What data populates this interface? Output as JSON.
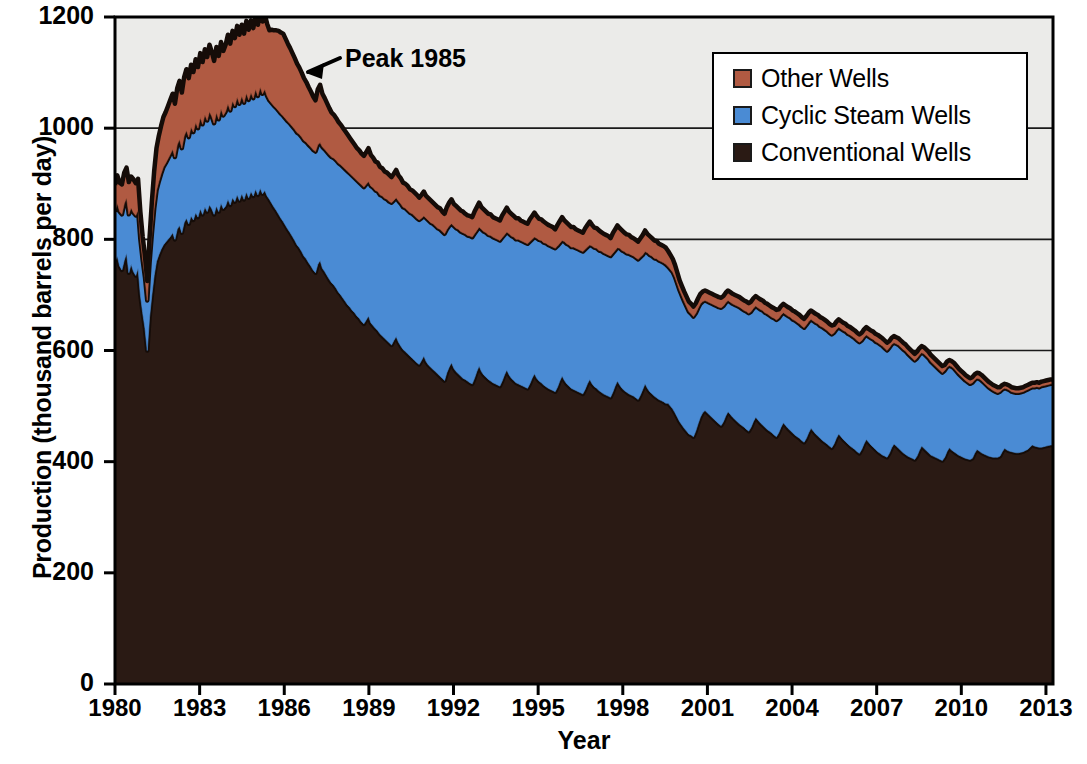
{
  "chart_data": {
    "type": "area",
    "stacked": true,
    "title": "",
    "xlabel": "Year",
    "ylabel": "Production (thousand barrels per day)",
    "xlim": [
      1980,
      2013.25
    ],
    "ylim": [
      0,
      1200
    ],
    "ytick_labels": [
      "0",
      "200",
      "400",
      "600",
      "800",
      "1000",
      "1200"
    ],
    "yticks": [
      0,
      200,
      400,
      600,
      800,
      1000,
      1200
    ],
    "xtick_labels": [
      "1980",
      "1983",
      "1986",
      "1989",
      "1992",
      "1995",
      "1998",
      "2001",
      "2004",
      "2007",
      "2010",
      "2013"
    ],
    "xticks": [
      1980,
      1983,
      1986,
      1989,
      1992,
      1995,
      1998,
      2001,
      2004,
      2007,
      2010,
      2013
    ],
    "grid": "horizontal",
    "legend_position": "top-right",
    "plot_background": "#ebebe9",
    "series": [
      {
        "name": "Conventional Wells",
        "color": "#2a1a14",
        "order": 1,
        "values": [
          760,
          770,
          752,
          745,
          762,
          775,
          740,
          755,
          742,
          735,
          748,
          700,
          668,
          640,
          600,
          660,
          700,
          735,
          760,
          772,
          782,
          790,
          795,
          800,
          805,
          812,
          800,
          818,
          825,
          812,
          830,
          838,
          828,
          842,
          835,
          848,
          840,
          855,
          845,
          858,
          850,
          862,
          855,
          845,
          860,
          850,
          865,
          855,
          860,
          872,
          862,
          875,
          868,
          880,
          870,
          882,
          872,
          885,
          875,
          886,
          878,
          890,
          880,
          892,
          882,
          888,
          878,
          872,
          865,
          858,
          852,
          845,
          838,
          832,
          825,
          818,
          812,
          805,
          798,
          790,
          785,
          778,
          770,
          765,
          758,
          752,
          745,
          740,
          755,
          762,
          748,
          742,
          735,
          728,
          722,
          718,
          712,
          705,
          700,
          694,
          688,
          682,
          678,
          672,
          668,
          662,
          658,
          652,
          648,
          655,
          662,
          650,
          645,
          640,
          636,
          630,
          626,
          622,
          618,
          614,
          610,
          618,
          625,
          615,
          608,
          602,
          598,
          594,
          590,
          586,
          582,
          578,
          575,
          582,
          590,
          580,
          574,
          570,
          566,
          562,
          558,
          554,
          550,
          546,
          560,
          570,
          578,
          568,
          562,
          558,
          554,
          550,
          548,
          545,
          542,
          540,
          550,
          562,
          572,
          562,
          556,
          552,
          548,
          545,
          542,
          540,
          538,
          536,
          545,
          556,
          565,
          556,
          550,
          546,
          542,
          540,
          538,
          536,
          534,
          532,
          540,
          550,
          558,
          550,
          545,
          542,
          538,
          535,
          532,
          530,
          528,
          526,
          534,
          545,
          554,
          546,
          540,
          536,
          532,
          530,
          528,
          526,
          524,
          522,
          530,
          540,
          548,
          540,
          535,
          532,
          528,
          525,
          522,
          520,
          518,
          516,
          525,
          536,
          545,
          538,
          532,
          528,
          525,
          522,
          520,
          518,
          515,
          512,
          520,
          530,
          540,
          532,
          526,
          522,
          518,
          515,
          512,
          510,
          508,
          505,
          505,
          500,
          495,
          488,
          480,
          472,
          466,
          460,
          455,
          450,
          448,
          445,
          455,
          468,
          480,
          488,
          492,
          488,
          484,
          480,
          476,
          472,
          468,
          465,
          472,
          482,
          490,
          485,
          480,
          476,
          472,
          468,
          465,
          462,
          458,
          455,
          462,
          472,
          480,
          475,
          470,
          466,
          462,
          458,
          455,
          452,
          448,
          445,
          452,
          462,
          470,
          465,
          460,
          456,
          452,
          448,
          445,
          442,
          438,
          435,
          442,
          452,
          460,
          455,
          450,
          446,
          442,
          438,
          435,
          432,
          428,
          425,
          432,
          442,
          450,
          445,
          440,
          436,
          432,
          428,
          425,
          422,
          418,
          415,
          422,
          432,
          440,
          435,
          430,
          426,
          422,
          418,
          415,
          412,
          410,
          408,
          415,
          425,
          432,
          428,
          424,
          420,
          416,
          413,
          410,
          408,
          406,
          404,
          410,
          420,
          428,
          424,
          420,
          416,
          412,
          410,
          408,
          406,
          404,
          402,
          408,
          418,
          425,
          421,
          418,
          415,
          412,
          410,
          408,
          406,
          405,
          404,
          406,
          415,
          422,
          419,
          416,
          414,
          412,
          410,
          409,
          408,
          408,
          408,
          410,
          418,
          424,
          421,
          419,
          418,
          417,
          416,
          416,
          417,
          418,
          420,
          422,
          426,
          430,
          428,
          427,
          426,
          426,
          427,
          428,
          429,
          430,
          430
        ]
      },
      {
        "name": "Cyclic Steam Wells",
        "color": "#4a8bd4",
        "order": 2,
        "values": [
          90,
          95,
          98,
          100,
          102,
          100,
          105,
          102,
          106,
          108,
          105,
          100,
          95,
          92,
          90,
          98,
          110,
          120,
          128,
          132,
          136,
          140,
          142,
          145,
          148,
          150,
          148,
          152,
          155,
          152,
          156,
          158,
          156,
          160,
          158,
          162,
          160,
          164,
          162,
          166,
          164,
          168,
          166,
          164,
          168,
          166,
          170,
          168,
          170,
          172,
          170,
          174,
          172,
          176,
          174,
          176,
          174,
          178,
          176,
          178,
          176,
          180,
          178,
          182,
          180,
          182,
          180,
          178,
          180,
          182,
          184,
          186,
          188,
          190,
          192,
          194,
          196,
          198,
          200,
          202,
          204,
          206,
          208,
          210,
          212,
          214,
          216,
          218,
          215,
          212,
          218,
          220,
          222,
          224,
          226,
          228,
          230,
          232,
          234,
          236,
          238,
          240,
          240,
          242,
          242,
          244,
          244,
          246,
          246,
          244,
          242,
          246,
          248,
          248,
          250,
          250,
          252,
          252,
          254,
          254,
          256,
          252,
          250,
          254,
          256,
          256,
          258,
          258,
          258,
          260,
          260,
          260,
          260,
          256,
          252,
          258,
          260,
          260,
          262,
          262,
          262,
          264,
          264,
          264,
          258,
          254,
          250,
          256,
          258,
          260,
          260,
          262,
          262,
          262,
          264,
          264,
          260,
          254,
          250,
          256,
          258,
          260,
          260,
          262,
          262,
          262,
          262,
          262,
          258,
          252,
          248,
          254,
          256,
          258,
          258,
          260,
          260,
          260,
          260,
          260,
          256,
          250,
          246,
          252,
          254,
          256,
          256,
          258,
          258,
          258,
          258,
          258,
          254,
          248,
          244,
          250,
          252,
          254,
          254,
          256,
          256,
          256,
          256,
          256,
          252,
          246,
          242,
          248,
          250,
          252,
          252,
          254,
          254,
          254,
          254,
          254,
          250,
          244,
          240,
          246,
          248,
          250,
          250,
          252,
          252,
          252,
          252,
          252,
          248,
          242,
          238,
          244,
          246,
          248,
          248,
          250,
          250,
          250,
          250,
          250,
          246,
          246,
          246,
          244,
          240,
          236,
          232,
          228,
          224,
          220,
          218,
          216,
          212,
          208,
          204,
          200,
          198,
          200,
          202,
          204,
          206,
          208,
          210,
          212,
          208,
          204,
          200,
          202,
          204,
          206,
          208,
          210,
          210,
          210,
          212,
          212,
          208,
          204,
          200,
          202,
          204,
          206,
          206,
          208,
          208,
          208,
          210,
          210,
          206,
          202,
          198,
          200,
          202,
          204,
          204,
          206,
          206,
          206,
          206,
          206,
          204,
          200,
          196,
          198,
          200,
          202,
          202,
          204,
          204,
          204,
          204,
          204,
          200,
          196,
          192,
          194,
          196,
          198,
          198,
          200,
          200,
          200,
          200,
          200,
          196,
          192,
          188,
          190,
          192,
          194,
          194,
          196,
          196,
          196,
          194,
          192,
          190,
          186,
          182,
          184,
          186,
          186,
          186,
          186,
          184,
          182,
          180,
          178,
          176,
          172,
          168,
          170,
          170,
          170,
          168,
          166,
          164,
          162,
          160,
          158,
          156,
          152,
          148,
          150,
          150,
          148,
          146,
          144,
          142,
          140,
          138,
          136,
          136,
          132,
          128,
          130,
          130,
          128,
          126,
          124,
          122,
          120,
          118,
          116,
          116,
          112,
          108,
          110,
          110,
          108,
          108,
          108,
          108,
          108,
          108,
          108,
          108,
          106,
          104,
          106,
          108,
          108,
          110,
          110,
          110,
          110,
          110,
          110
        ]
      },
      {
        "name": "Other Wells",
        "color": "#b05a42",
        "order": 3,
        "values": [
          48,
          50,
          52,
          54,
          56,
          54,
          58,
          56,
          60,
          58,
          56,
          50,
          42,
          38,
          35,
          45,
          58,
          68,
          76,
          82,
          86,
          90,
          92,
          95,
          98,
          100,
          96,
          102,
          105,
          100,
          106,
          110,
          106,
          112,
          108,
          114,
          110,
          116,
          112,
          118,
          114,
          120,
          116,
          112,
          118,
          114,
          120,
          116,
          120,
          124,
          120,
          126,
          122,
          128,
          124,
          128,
          124,
          130,
          126,
          130,
          126,
          132,
          128,
          134,
          130,
          134,
          130,
          126,
          132,
          136,
          140,
          144,
          146,
          148,
          144,
          140,
          136,
          132,
          128,
          124,
          120,
          116,
          112,
          108,
          104,
          100,
          96,
          92,
          100,
          104,
          96,
          92,
          88,
          84,
          80,
          78,
          76,
          74,
          72,
          70,
          68,
          66,
          64,
          62,
          60,
          58,
          58,
          56,
          56,
          58,
          60,
          56,
          54,
          52,
          52,
          50,
          50,
          48,
          48,
          48,
          46,
          48,
          50,
          46,
          46,
          44,
          44,
          44,
          42,
          42,
          42,
          42,
          40,
          42,
          44,
          40,
          40,
          40,
          38,
          38,
          38,
          38,
          36,
          36,
          40,
          42,
          44,
          40,
          40,
          38,
          38,
          38,
          36,
          36,
          36,
          36,
          40,
          42,
          44,
          40,
          40,
          38,
          38,
          38,
          36,
          36,
          36,
          36,
          40,
          42,
          44,
          40,
          40,
          38,
          38,
          38,
          36,
          36,
          36,
          36,
          40,
          42,
          44,
          40,
          38,
          38,
          38,
          36,
          36,
          36,
          36,
          34,
          38,
          40,
          42,
          38,
          38,
          36,
          36,
          36,
          34,
          34,
          34,
          34,
          38,
          40,
          42,
          38,
          36,
          36,
          36,
          34,
          34,
          34,
          34,
          32,
          36,
          38,
          40,
          36,
          36,
          34,
          34,
          34,
          32,
          32,
          32,
          32,
          34,
          36,
          38,
          34,
          34,
          32,
          32,
          32,
          30,
          30,
          30,
          30,
          28,
          26,
          24,
          22,
          20,
          18,
          18,
          18,
          18,
          18,
          18,
          18,
          18,
          18,
          18,
          18,
          18,
          18,
          18,
          18,
          18,
          18,
          18,
          18,
          18,
          18,
          18,
          18,
          18,
          18,
          18,
          18,
          18,
          18,
          18,
          18,
          18,
          18,
          18,
          18,
          18,
          18,
          18,
          18,
          18,
          18,
          18,
          18,
          16,
          16,
          16,
          16,
          16,
          16,
          16,
          16,
          16,
          16,
          16,
          16,
          16,
          16,
          16,
          16,
          16,
          16,
          16,
          16,
          16,
          16,
          16,
          16,
          14,
          14,
          14,
          14,
          14,
          14,
          14,
          14,
          14,
          14,
          14,
          14,
          14,
          14,
          14,
          14,
          14,
          14,
          14,
          14,
          14,
          14,
          14,
          14,
          12,
          12,
          12,
          12,
          12,
          12,
          12,
          12,
          12,
          12,
          12,
          12,
          12,
          12,
          12,
          12,
          12,
          12,
          12,
          12,
          12,
          12,
          12,
          12,
          10,
          10,
          10,
          10,
          10,
          10,
          10,
          10,
          10,
          10,
          10,
          10,
          10,
          10,
          10,
          10,
          10,
          10,
          10,
          10,
          10,
          10,
          10,
          10,
          8,
          8,
          8,
          8,
          8,
          8,
          8,
          8,
          8,
          8,
          8,
          8,
          8,
          8,
          8,
          8,
          8,
          8,
          8,
          8,
          8,
          8,
          8,
          8
        ]
      }
    ],
    "annotations": [
      {
        "text": "Peak 1985",
        "year": 1986.1,
        "value": 1105,
        "arrow": "points-down-left"
      }
    ]
  },
  "legend": {
    "items": [
      {
        "label": "Other Wells",
        "color": "#b05a42"
      },
      {
        "label": "Cyclic Steam Wells",
        "color": "#4a8bd4"
      },
      {
        "label": "Conventional Wells",
        "color": "#2a1a14"
      }
    ]
  },
  "axes": {
    "xlabel": "Year",
    "ylabel": "Production (thousand barrels per day)"
  },
  "annotation": {
    "peak_label": "Peak 1985"
  }
}
